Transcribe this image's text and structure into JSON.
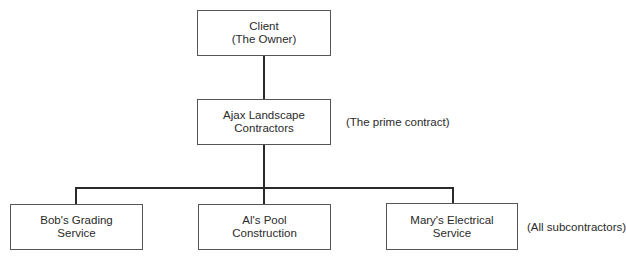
{
  "diagram": {
    "nodes": [
      {
        "id": "client",
        "lines": [
          "Client",
          "(The Owner)"
        ]
      },
      {
        "id": "ajax",
        "lines": [
          "Ajax Landscape",
          "Contractors"
        ]
      },
      {
        "id": "bob",
        "lines": [
          "Bob's Grading",
          "Service"
        ]
      },
      {
        "id": "al",
        "lines": [
          "Al's Pool",
          "Construction"
        ]
      },
      {
        "id": "mary",
        "lines": [
          "Mary's Electrical",
          "Service"
        ]
      }
    ],
    "annotations": {
      "prime": "(The prime contract)",
      "subs": "(All subcontractors)"
    },
    "edges": [
      {
        "from": "client",
        "to": "ajax"
      },
      {
        "from": "ajax",
        "to": "bob"
      },
      {
        "from": "ajax",
        "to": "al"
      },
      {
        "from": "ajax",
        "to": "mary"
      }
    ],
    "colors": {
      "line": "#2a2a2a",
      "border": "#555555",
      "text": "#2a2a2a"
    }
  }
}
